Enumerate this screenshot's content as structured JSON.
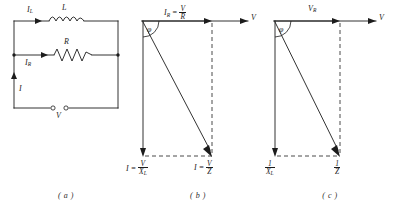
{
  "panels": [
    {
      "id": "a",
      "caption": "( a )",
      "type": "circuit",
      "components": {
        "inductor_label": "L",
        "resistor_label": "R",
        "source_label": "V"
      },
      "currents": {
        "inductor_branch": "I",
        "inductor_branch_sub": "L",
        "resistor_branch": "I",
        "resistor_branch_sub": "R",
        "total": "I"
      }
    },
    {
      "id": "b",
      "caption": "( b )",
      "type": "phasor",
      "axis_label": "V",
      "angle_label": "φ",
      "top_label": {
        "lead": "I",
        "lead_sub": "R",
        "equals": " = ",
        "num": "V",
        "den": "R"
      },
      "bottom_left_label": {
        "lead": "I",
        "equals": " = ",
        "num": "V",
        "den": "X",
        "den_sub": "L"
      },
      "bottom_right_label": {
        "lead": "I",
        "equals": " = ",
        "num": "V",
        "den": "Z"
      }
    },
    {
      "id": "c",
      "caption": "( c )",
      "type": "admittance",
      "axis_label": "V",
      "angle_label": "φ",
      "top_label": {
        "lead": "V",
        "lead_sub": "R"
      },
      "bottom_left_label": {
        "num": "1",
        "den": "X",
        "den_sub": "L"
      },
      "bottom_right_label": {
        "num": "1",
        "den": "Z"
      }
    }
  ],
  "colors": {
    "ink": "#1c1c1c",
    "background": "#ffffff"
  }
}
